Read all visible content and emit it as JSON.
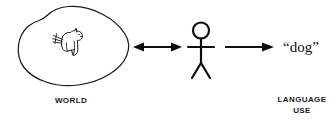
{
  "diagram": {
    "background_color": "#ffffff",
    "ink_color": "#111111",
    "world": {
      "shape_name": "blob-outline",
      "caption": "WORLD",
      "contains_icon": "dog-sketch",
      "icon_description": "dog"
    },
    "person": {
      "icon_name": "stick-figure-person",
      "caption": ""
    },
    "language": {
      "token": "“dog”",
      "caption_line1": "LANGUAGE",
      "caption_line2": "USE"
    },
    "arrows": [
      {
        "name": "world-person-arrow",
        "direction": "bidirectional",
        "from": "WORLD",
        "to": "person",
        "label": ""
      },
      {
        "name": "person-language-arrow",
        "direction": "right",
        "from": "person",
        "to": "“dog”",
        "label": ""
      }
    ]
  }
}
